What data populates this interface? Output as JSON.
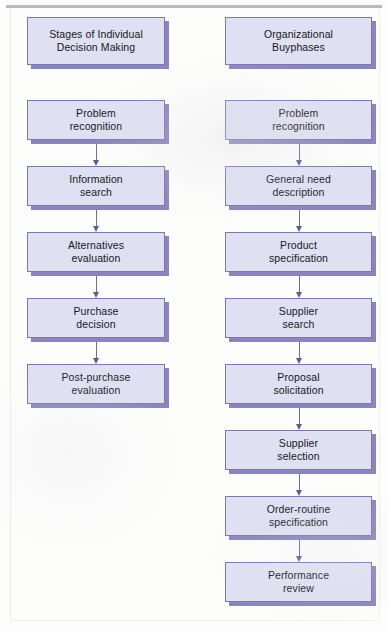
{
  "figure": {
    "type": "flowchart",
    "columns": 2,
    "colors": {
      "node_fill": "#dfe0f2",
      "node_border": "#7b76b4",
      "node_shadow": "#8b85bd",
      "arrow": "#6f6aa8",
      "text": "#18181c",
      "page_background": "#fdfdfc",
      "frame_line": "#b9b8c6"
    }
  },
  "left_column": {
    "header": {
      "label": "Stages of Individual\nDecision Making",
      "x": 27,
      "y": 17,
      "width": 138,
      "height": 48
    },
    "steps": [
      {
        "label": "Problem\nrecognition",
        "x": 27,
        "y": 100,
        "width": 138,
        "height": 40
      },
      {
        "label": "Information\nsearch",
        "x": 27,
        "y": 166,
        "width": 138,
        "height": 40
      },
      {
        "label": "Alternatives\nevaluation",
        "x": 27,
        "y": 232,
        "width": 138,
        "height": 40
      },
      {
        "label": "Purchase\ndecision",
        "x": 27,
        "y": 298,
        "width": 138,
        "height": 40
      },
      {
        "label": "Post-purchase\nevaluation",
        "x": 27,
        "y": 364,
        "width": 138,
        "height": 40
      }
    ],
    "step_count": 5,
    "connector_count": 4
  },
  "right_column": {
    "header": {
      "label": "Organizational\nBuyphases",
      "x": 225,
      "y": 17,
      "width": 147,
      "height": 48
    },
    "steps": [
      {
        "label": "Problem\nrecognition",
        "x": 225,
        "y": 100,
        "width": 147,
        "height": 40
      },
      {
        "label": "General need\ndescription",
        "x": 225,
        "y": 166,
        "width": 147,
        "height": 40
      },
      {
        "label": "Product\nspecification",
        "x": 225,
        "y": 232,
        "width": 147,
        "height": 40
      },
      {
        "label": "Supplier\nsearch",
        "x": 225,
        "y": 298,
        "width": 147,
        "height": 40
      },
      {
        "label": "Proposal\nsolicitation",
        "x": 225,
        "y": 364,
        "width": 147,
        "height": 40
      },
      {
        "label": "Supplier\nselection",
        "x": 225,
        "y": 430,
        "width": 147,
        "height": 40
      },
      {
        "label": "Order-routine\nspecification",
        "x": 225,
        "y": 496,
        "width": 147,
        "height": 40
      },
      {
        "label": "Performance\nreview",
        "x": 225,
        "y": 562,
        "width": 147,
        "height": 40
      }
    ],
    "step_count": 8,
    "connector_count": 7
  }
}
